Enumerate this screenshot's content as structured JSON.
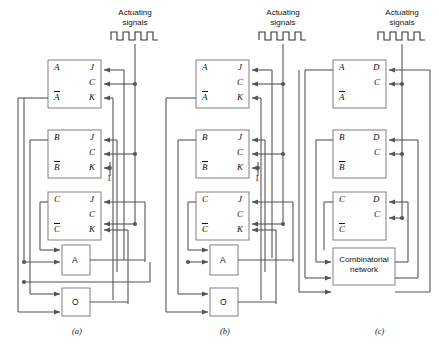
{
  "figure": {
    "wire_color": "#555555",
    "box_border_color": "#888888",
    "text_color": "#111111",
    "panels": [
      {
        "id": "a",
        "caption": "(a)",
        "clock_header": "Actuating\nsignals",
        "clock_line1": "Actuating",
        "clock_line2": "signals",
        "clock_icon": "square-wave-icon",
        "flipflop_type": "JK",
        "flipflops": [
          {
            "q": "A",
            "qbar": "A",
            "inputs": [
              "J",
              "C",
              "K"
            ]
          },
          {
            "q": "B",
            "qbar": "B",
            "inputs": [
              "J",
              "C",
              "K"
            ]
          },
          {
            "q": "C",
            "qbar": "C",
            "inputs": [
              "J",
              "C",
              "K"
            ]
          }
        ],
        "gates": [
          {
            "label": "A",
            "name": "and-gate"
          },
          {
            "label": "O",
            "name": "or-gate"
          }
        ],
        "constant_label": "1"
      },
      {
        "id": "b",
        "caption": "(b)",
        "clock_line1": "Actuating",
        "clock_line2": "signals",
        "clock_icon": "square-wave-icon",
        "flipflop_type": "JK",
        "flipflops": [
          {
            "q": "A",
            "qbar": "A",
            "inputs": [
              "J",
              "C",
              "K"
            ]
          },
          {
            "q": "B",
            "qbar": "B",
            "inputs": [
              "J",
              "C",
              "K"
            ]
          },
          {
            "q": "C",
            "qbar": "C",
            "inputs": [
              "J",
              "C",
              "K"
            ]
          }
        ],
        "gates": [
          {
            "label": "A",
            "name": "and-gate"
          },
          {
            "label": "O",
            "name": "or-gate"
          }
        ],
        "constant_label": "1"
      },
      {
        "id": "c",
        "caption": "(c)",
        "clock_line1": "Actuating",
        "clock_line2": "signals",
        "clock_icon": "square-wave-icon",
        "flipflop_type": "D",
        "flipflops": [
          {
            "q": "A",
            "qbar": "A",
            "inputs": [
              "D",
              "C"
            ]
          },
          {
            "q": "B",
            "qbar": "B",
            "inputs": [
              "D",
              "C"
            ]
          },
          {
            "q": "C",
            "qbar": "C",
            "inputs": [
              "D",
              "C"
            ]
          }
        ],
        "network": {
          "line1": "Combinatorial",
          "line2": "network",
          "name": "combinatorial-network"
        }
      }
    ]
  }
}
